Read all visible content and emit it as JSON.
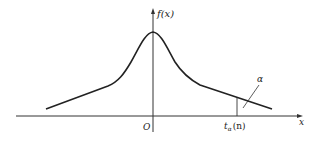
{
  "diagram": {
    "y_axis_label": "f(x)",
    "x_axis_label": "x",
    "origin_label": "O",
    "quantile_label": {
      "base": "t",
      "subscript": "α",
      "argument": "(n)"
    },
    "tail_area_label": "α",
    "colors": {
      "line": "#222222",
      "axis": "#333333",
      "background": "#ffffff"
    }
  }
}
